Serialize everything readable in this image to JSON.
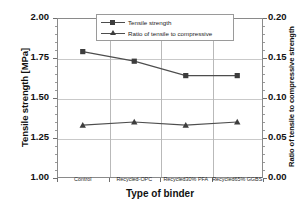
{
  "chart_data": {
    "type": "line",
    "title": "",
    "subtitle": "",
    "xlabel": "Type of binder",
    "ylabel": "Tensile strength  [MPa]",
    "y2label": "Ratio of tensile to compressive strength",
    "categories": [
      "Control",
      "Recycled-OPC",
      "Recycled30% PFA",
      "Recycled65% GGBS"
    ],
    "ylim": [
      1.0,
      2.0
    ],
    "y2lim": [
      0.0,
      0.2
    ],
    "yticks": [
      "1.00",
      "1.25",
      "1.50",
      "1.75",
      "2.00"
    ],
    "ytick_values": [
      1.0,
      1.25,
      1.5,
      1.75,
      2.0
    ],
    "y2ticks": [
      "0.00",
      "0.05",
      "0.10",
      "0.15",
      "0.20"
    ],
    "y2tick_values": [
      0.0,
      0.05,
      0.1,
      0.15,
      0.2
    ],
    "grid": true,
    "legend_position": "top-center",
    "series": [
      {
        "name": "Tensile strength",
        "axis": "left",
        "marker": "square",
        "color": "#4d4d4d",
        "values": [
          1.79,
          1.73,
          1.64,
          1.64
        ]
      },
      {
        "name": "Ratio of tensile to compressive",
        "axis": "right",
        "marker": "triangle",
        "color": "#4d4d4d",
        "values": [
          0.066,
          0.07,
          0.066,
          0.07
        ]
      }
    ]
  },
  "legend": {
    "entries": [
      {
        "label": "Tensile strength"
      },
      {
        "label": "Ratio of tensile to compressive"
      }
    ]
  },
  "axes": {
    "left_title": "Tensile strength  [MPa]",
    "right_title": "Ratio of tensile to compressive strength",
    "bottom_title": "Type of binder"
  }
}
